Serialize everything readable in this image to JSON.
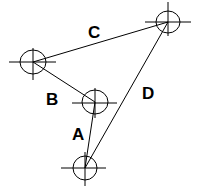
{
  "diagram": {
    "nodes": [
      {
        "id": "top-right",
        "x": 168,
        "y": 22,
        "rx": 12,
        "ry": 11
      },
      {
        "id": "left",
        "x": 33,
        "y": 62,
        "rx": 13,
        "ry": 12
      },
      {
        "id": "middle",
        "x": 95,
        "y": 102,
        "rx": 13,
        "ry": 12
      },
      {
        "id": "bottom",
        "x": 85,
        "y": 168,
        "rx": 12,
        "ry": 12
      }
    ],
    "edges": [
      {
        "label": "A",
        "from": "middle",
        "to": "bottom"
      },
      {
        "label": "B",
        "from": "left",
        "to": "middle"
      },
      {
        "label": "C",
        "from": "left",
        "to": "top-right"
      },
      {
        "label": "D",
        "from": "bottom",
        "to": "top-right"
      }
    ],
    "labels": {
      "A": "A",
      "B": "B",
      "C": "C",
      "D": "D"
    }
  }
}
